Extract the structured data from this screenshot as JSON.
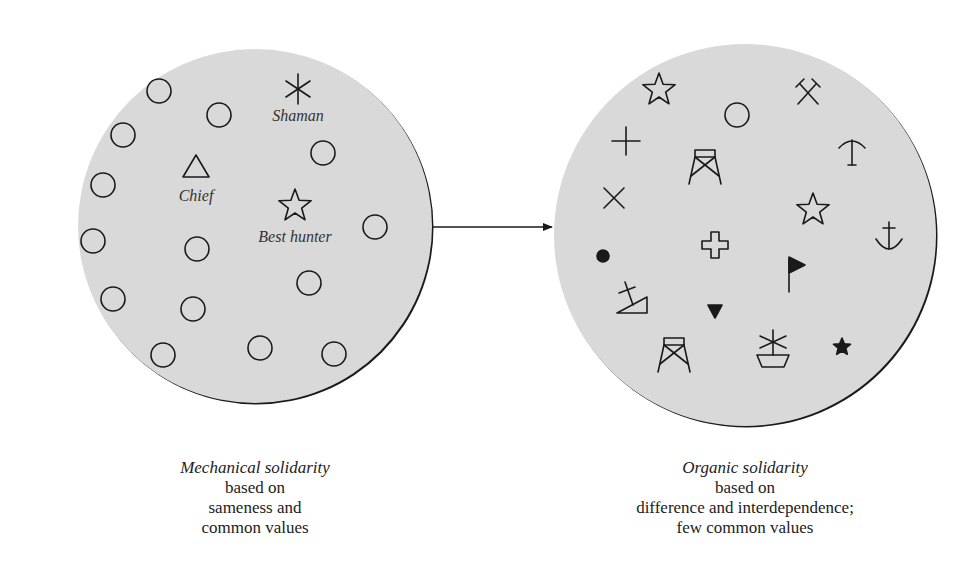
{
  "colors": {
    "disc_fill": "#d9d9d9",
    "stroke": "#1a1a1a",
    "background": "#ffffff"
  },
  "left_panel": {
    "disc": {
      "cx": 255,
      "cy": 226,
      "r": 177
    },
    "labels": [
      {
        "text": "Shaman",
        "x": 298,
        "y": 121
      },
      {
        "text": "Chief",
        "x": 196,
        "y": 201
      },
      {
        "text": "Best hunter",
        "x": 295,
        "y": 242
      }
    ],
    "symbols": [
      {
        "type": "ring",
        "x": 159,
        "y": 91
      },
      {
        "type": "ring",
        "x": 219,
        "y": 115
      },
      {
        "type": "ring",
        "x": 123,
        "y": 135
      },
      {
        "type": "ring",
        "x": 323,
        "y": 153
      },
      {
        "type": "ring",
        "x": 103,
        "y": 185
      },
      {
        "type": "ring",
        "x": 375,
        "y": 227
      },
      {
        "type": "ring",
        "x": 93,
        "y": 241
      },
      {
        "type": "ring",
        "x": 197,
        "y": 249
      },
      {
        "type": "ring",
        "x": 309,
        "y": 283
      },
      {
        "type": "ring",
        "x": 113,
        "y": 299
      },
      {
        "type": "ring",
        "x": 193,
        "y": 309
      },
      {
        "type": "ring",
        "x": 163,
        "y": 355
      },
      {
        "type": "ring",
        "x": 260,
        "y": 348
      },
      {
        "type": "ring",
        "x": 334,
        "y": 354
      },
      {
        "type": "asterisk",
        "x": 298,
        "y": 89
      },
      {
        "type": "triangle",
        "x": 196,
        "y": 167
      },
      {
        "type": "star-outline",
        "x": 295,
        "y": 206
      }
    ],
    "caption": {
      "title": "Mechanical solidarity",
      "lines": [
        "based on",
        "sameness and",
        "common values"
      ]
    }
  },
  "arrow": {
    "x1": 432,
    "y1": 227,
    "x2": 552,
    "y2": 227
  },
  "right_panel": {
    "disc": {
      "cx": 745,
      "cy": 235,
      "r": 191
    },
    "symbols": [
      {
        "type": "star-outline",
        "x": 659,
        "y": 90
      },
      {
        "type": "ring",
        "x": 737,
        "y": 115
      },
      {
        "type": "hammers",
        "x": 808,
        "y": 92
      },
      {
        "type": "plus",
        "x": 626,
        "y": 141
      },
      {
        "type": "tower",
        "x": 705,
        "y": 168
      },
      {
        "type": "anchor-up",
        "x": 852,
        "y": 150
      },
      {
        "type": "cross-x",
        "x": 614,
        "y": 198
      },
      {
        "type": "star-outline",
        "x": 813,
        "y": 210
      },
      {
        "type": "anchor",
        "x": 889,
        "y": 237
      },
      {
        "type": "greek-cross",
        "x": 715,
        "y": 245
      },
      {
        "type": "dot",
        "x": 603,
        "y": 256
      },
      {
        "type": "flag",
        "x": 795,
        "y": 272
      },
      {
        "type": "church-slope",
        "x": 631,
        "y": 296
      },
      {
        "type": "triangle-down-filled",
        "x": 715,
        "y": 311
      },
      {
        "type": "tower",
        "x": 674,
        "y": 356
      },
      {
        "type": "ship-mast",
        "x": 773,
        "y": 352
      },
      {
        "type": "star-filled",
        "x": 842,
        "y": 347
      }
    ],
    "caption": {
      "title": "Organic solidarity",
      "lines": [
        "based on",
        "difference and interdependence;",
        "few common values"
      ]
    }
  }
}
